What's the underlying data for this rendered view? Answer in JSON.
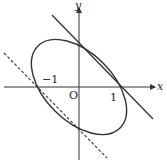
{
  "diagram": {
    "type": "ellipse with tangent lines",
    "axes": {
      "x_label": "x",
      "y_label": "y",
      "origin_label": "O"
    },
    "tick_labels": {
      "neg_one": "−1",
      "one": "1"
    },
    "elements": [
      {
        "kind": "ellipse",
        "style": "solid",
        "description": "tilted ellipse centered at origin"
      },
      {
        "kind": "line",
        "style": "solid",
        "description": "tangent line upper-right"
      },
      {
        "kind": "line",
        "style": "dashed",
        "description": "parallel tangent line lower-left"
      }
    ],
    "colors": {
      "stroke": "#333333",
      "background": "#ffffff"
    }
  }
}
